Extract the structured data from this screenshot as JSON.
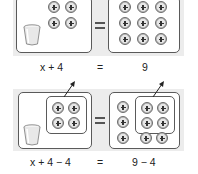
{
  "diagram": {
    "colors": {
      "panel_bg": "#ececec",
      "box_border": "#5a5a5a",
      "token_fill": "#e6e6e6",
      "token_ring": "#bdbdbd",
      "text": "#222222"
    },
    "top": {
      "left_side": {
        "cup_count": 1,
        "positive_tokens": 4
      },
      "right_side": {
        "positive_tokens": 9
      },
      "equation": {
        "left": "x + 4",
        "equals": "=",
        "right": "9"
      }
    },
    "bottom": {
      "left_side": {
        "cup_count": 1,
        "positive_tokens": 4,
        "grouped_removed": 4
      },
      "right_side": {
        "positive_tokens": 9,
        "grouped_removed": 4
      },
      "equation": {
        "left": "x + 4 − 4",
        "equals": "=",
        "right": "9 − 4"
      }
    }
  }
}
